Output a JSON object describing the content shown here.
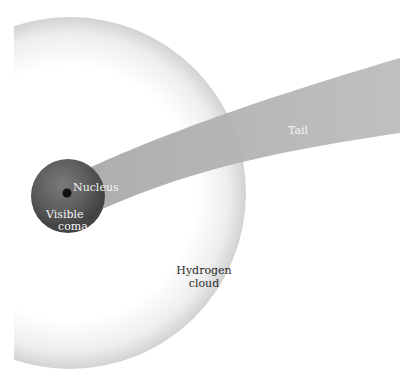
{
  "diagram": {
    "type": "comet-structure",
    "labels": {
      "nucleus": "Nucleus",
      "coma_line1": "Visible",
      "coma_line2": "coma",
      "tail": "Tail",
      "hydrogen_line1": "Hydrogen",
      "hydrogen_line2": "cloud"
    },
    "colors": {
      "background": "#ffffff",
      "hydrogen_cloud_edge": "#cfcfcf",
      "tail": "#b5b5b5",
      "coma": "#5a5a5a",
      "nucleus": "#111111"
    }
  }
}
